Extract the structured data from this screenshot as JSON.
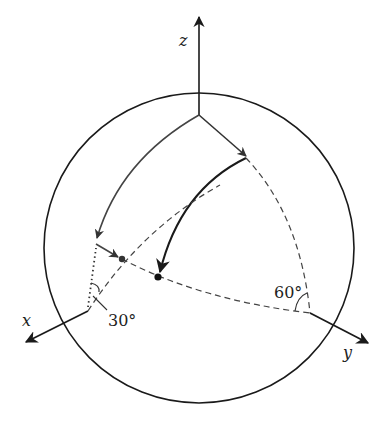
{
  "diagram": {
    "type": "sphere-rotation",
    "axes": {
      "x": {
        "label": "x"
      },
      "y": {
        "label": "y"
      },
      "z": {
        "label": "z"
      }
    },
    "angles": {
      "alpha": {
        "label": "30°"
      },
      "beta": {
        "label": "60°"
      }
    },
    "colors": {
      "stroke": "#1a1a1a",
      "gray_stroke": "#444444",
      "background": "#ffffff"
    }
  }
}
